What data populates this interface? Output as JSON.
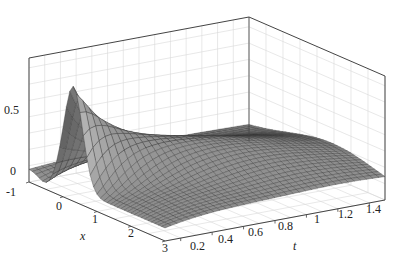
{
  "chart_data": {
    "type": "surface3d",
    "title": "",
    "xlabel": "x",
    "ylabel": "t",
    "zlabel": "",
    "x_ticks": [
      "-1",
      "0",
      "1",
      "2",
      "3"
    ],
    "t_ticks": [
      "0.2",
      "0.4",
      "0.6",
      "0.8",
      "1",
      "1.2",
      "1.4"
    ],
    "z_ticks": [
      "0",
      "0.5"
    ],
    "xlim": [
      -1,
      3
    ],
    "tlim": [
      0.1,
      1.5
    ],
    "zlim": [
      -0.1,
      0.85
    ],
    "grid": true,
    "surface_description": "Single localized pulse: sharp peak of about 0.78 near x=0.3 at t=0.1, with a small negative dip (about -0.05) at x near -0.5; the pulse rapidly decays and spreads, forming a broad low plateau (~0.15 to 0.2) for t > 0.4 that slowly flattens toward 0 as t approaches 1.5 and x approaches 3.",
    "peak": {
      "x": 0.3,
      "t": 0.1,
      "z": 0.78
    },
    "dip": {
      "x": -0.5,
      "t": 0.1,
      "z": -0.05
    },
    "colormap": "gray",
    "mesh_color": "#333333",
    "face_color": "#8c8c8c"
  },
  "axes": {
    "x_label": "x",
    "t_label": "t",
    "x_tick_labels": [
      "-1",
      "0",
      "1",
      "2",
      "3"
    ],
    "t_tick_labels": [
      "0.2",
      "0.4",
      "0.6",
      "0.8",
      "1",
      "1.2",
      "1.4"
    ],
    "z_tick_labels": [
      "0",
      "0.5"
    ]
  }
}
